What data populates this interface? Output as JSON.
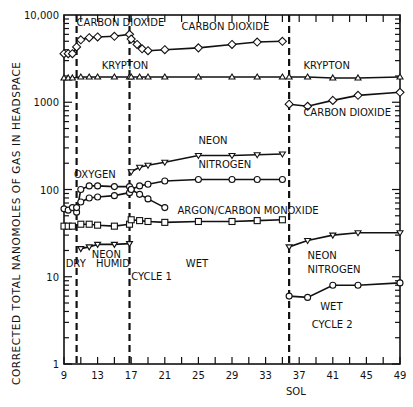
{
  "chart_data": {
    "type": "line",
    "title": "",
    "xlabel": "SOL",
    "ylabel": "CORRECTED TOTAL NANOMOLES OF GAS IN HEADSPACE",
    "yscale": "log",
    "ylim": [
      1,
      10000
    ],
    "xlim": [
      9,
      49
    ],
    "x_ticks": [
      9,
      13,
      17,
      21,
      25,
      29,
      33,
      37,
      41,
      45,
      49
    ],
    "y_ticks": [
      {
        "value": 1,
        "label": "1"
      },
      {
        "value": 10,
        "label": "10"
      },
      {
        "value": 100,
        "label": "100"
      },
      {
        "value": 1000,
        "label": "1000"
      },
      {
        "value": 10000,
        "label": "10,000"
      }
    ],
    "grid": false,
    "phase_dividers": [
      10.5,
      16.8,
      35.8
    ],
    "phase_labels": [
      {
        "text": "DRY",
        "x": 9.2,
        "y": 13
      },
      {
        "text": "HUMID",
        "x": 12.8,
        "y": 13
      },
      {
        "text": "CYCLE 1",
        "x": 17.0,
        "y": 9.2
      },
      {
        "text": "WET",
        "x": 23.5,
        "y": 13
      },
      {
        "text": "WET",
        "x": 39.5,
        "y": 4.2
      },
      {
        "text": "CYCLE 2",
        "x": 38.5,
        "y": 2.6
      }
    ],
    "series": [
      {
        "name": "CARBON DIOXIDE",
        "marker": "diamond",
        "segments": [
          {
            "x": [
              9,
              9.5,
              10,
              10.5
            ],
            "y": [
              3600,
              3600,
              3600,
              4300
            ]
          },
          {
            "x": [
              11,
              12,
              13,
              15,
              16.8
            ],
            "y": [
              5200,
              5500,
              5600,
              5700,
              6000
            ]
          },
          {
            "x": [
              17,
              17.7,
              18.3,
              19,
              21,
              25,
              29,
              32,
              35
            ],
            "y": [
              5300,
              4600,
              4100,
              3900,
              4000,
              4200,
              4600,
              4900,
              5000
            ]
          },
          {
            "x": [
              35.8,
              38,
              41,
              44,
              49
            ],
            "y": [
              950,
              900,
              1050,
              1200,
              1300
            ]
          }
        ],
        "labels": [
          {
            "text": "CARBON DIOXIDE",
            "x": 10.5,
            "y": 7500
          },
          {
            "text": "CARBON DIOXIDE",
            "x": 23,
            "y": 6800
          },
          {
            "text": "CARBON DIOXIDE",
            "x": 37.5,
            "y": 700
          }
        ]
      },
      {
        "name": "KRYPTON",
        "marker": "triangle",
        "segments": [
          {
            "x": [
              9,
              9.5,
              10,
              11,
              12,
              13,
              15,
              16.8
            ],
            "y": [
              1900,
              1900,
              1900,
              1950,
              1950,
              1950,
              1950,
              1950
            ]
          },
          {
            "x": [
              17,
              18,
              19,
              21,
              25,
              29,
              32,
              35
            ],
            "y": [
              1950,
              1950,
              1950,
              1950,
              1950,
              1950,
              1950,
              1950
            ]
          },
          {
            "x": [
              35.8,
              38,
              41,
              44,
              49
            ],
            "y": [
              1950,
              1950,
              1900,
              1900,
              1950
            ]
          }
        ],
        "labels": [
          {
            "text": "KRYPTON",
            "x": 13.5,
            "y": 2400
          },
          {
            "text": "KRYPTON",
            "x": 37.5,
            "y": 2400
          }
        ]
      },
      {
        "name": "OXYGEN",
        "marker": "circle",
        "segments": [
          {
            "x": [
              9,
              9.5,
              10,
              10.5,
              11,
              12,
              13,
              15,
              16.8
            ],
            "y": [
              60,
              58,
              62,
              55,
              100,
              110,
              110,
              108,
              108
            ]
          },
          {
            "x": [
              17,
              18,
              19,
              21
            ],
            "y": [
              100,
              88,
              78,
              62
            ]
          }
        ],
        "labels": [
          {
            "text": "OXYGEN",
            "x": 10.2,
            "y": 135
          }
        ]
      },
      {
        "name": "NEON",
        "marker": "triangle-down",
        "segments": [
          {
            "x": [
              11,
              12,
              13,
              15,
              16.8
            ],
            "y": [
              21,
              22,
              23.5,
              23.5,
              24
            ]
          },
          {
            "x": [
              17,
              18,
              19,
              21,
              25,
              29,
              32,
              35
            ],
            "y": [
              160,
              180,
              190,
              205,
              245,
              245,
              250,
              255
            ]
          },
          {
            "x": [
              35.8,
              38,
              41,
              44,
              49
            ],
            "y": [
              22,
              26,
              30,
              32,
              32
            ]
          }
        ],
        "labels": [
          {
            "text": "NEON",
            "x": 12.3,
            "y": 16.5
          },
          {
            "text": "NEON",
            "x": 25,
            "y": 330
          },
          {
            "text": "NEON",
            "x": 38,
            "y": 16
          }
        ]
      },
      {
        "name": "NITROGEN",
        "marker": "circle",
        "segments": [
          {
            "x": [
              10.5,
              11,
              12,
              13,
              15,
              16.8
            ],
            "y": [
              62,
              72,
              80,
              82,
              85,
              92
            ]
          },
          {
            "x": [
              17,
              18,
              19,
              21,
              25,
              29,
              32,
              35
            ],
            "y": [
              100,
              110,
              115,
              125,
              130,
              130,
              130,
              130
            ]
          },
          {
            "x": [
              35.8,
              38,
              41,
              44,
              49
            ],
            "y": [
              6,
              5.8,
              8,
              8,
              8.5
            ]
          }
        ],
        "labels": [
          {
            "text": "NITROGEN",
            "x": 25,
            "y": 175
          },
          {
            "text": "NITROGEN",
            "x": 38,
            "y": 11
          }
        ]
      },
      {
        "name": "ARGON/CARBON MONOXIDE",
        "marker": "square",
        "segments": [
          {
            "x": [
              9,
              9.5,
              10,
              11,
              12,
              13,
              15,
              16.8
            ],
            "y": [
              38,
              38,
              38,
              40,
              40,
              39,
              38,
              40
            ]
          },
          {
            "x": [
              17,
              18,
              19,
              21,
              25,
              29,
              32,
              35
            ],
            "y": [
              45,
              44,
              43,
              42,
              43,
              43,
              44,
              45
            ]
          }
        ],
        "labels": [
          {
            "text": "ARGON/CARBON MONOXIDE",
            "x": 22.5,
            "y": 52
          }
        ]
      }
    ]
  },
  "axis": {
    "ylabel": "CORRECTED TOTAL NANOMOLES OF GAS IN HEADSPACE",
    "xlabel": "SOL"
  }
}
